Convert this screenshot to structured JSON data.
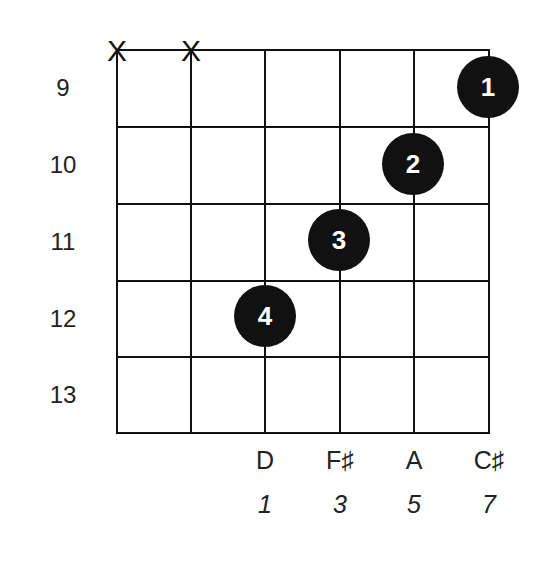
{
  "diagram": {
    "type": "guitar-chord-chart",
    "frets": [
      "9",
      "10",
      "11",
      "12",
      "13"
    ],
    "muted_strings": [
      "X",
      "X"
    ],
    "fingers": [
      {
        "label": "1",
        "string": 6,
        "fret": "9"
      },
      {
        "label": "2",
        "string": 5,
        "fret": "10"
      },
      {
        "label": "3",
        "string": 4,
        "fret": "11"
      },
      {
        "label": "4",
        "string": 3,
        "fret": "12"
      }
    ],
    "notes": [
      "D",
      "F♯",
      "A",
      "C♯"
    ],
    "degrees": [
      "1",
      "3",
      "5",
      "7"
    ]
  }
}
